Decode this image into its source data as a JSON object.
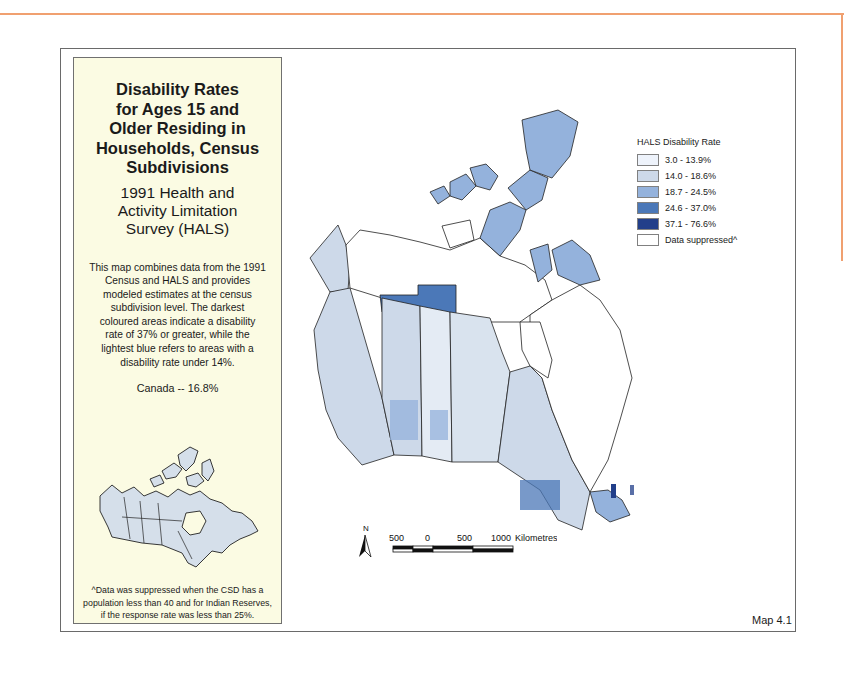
{
  "info_panel": {
    "title_lines": [
      "Disability Rates",
      "for Ages 15 and",
      "Older Residing in",
      "Households, Census",
      "Subdivisions"
    ],
    "subtitle_lines": [
      "1991 Health and",
      "Activity Limitation",
      "Survey (HALS)"
    ],
    "description_lines": [
      "This map combines data from the 1991",
      "Census and HALS and provides",
      "modeled estimates at the census",
      "subdivision level.  The darkest",
      "coloured areas indicate a disability",
      "rate of 37% or greater, while the",
      "lightest blue refers to areas with a",
      "disability rate under 14%."
    ],
    "national_rate": "Canada -- 16.8%",
    "footnote_lines": [
      "^Data was suppressed when the CSD has a",
      "population less than 40 and for Indian Reserves,",
      "if the response rate was less than 25%."
    ]
  },
  "legend": {
    "title": "HALS Disability Rate",
    "items": [
      {
        "label": "3.0 - 13.9%",
        "color": "#eef3fb"
      },
      {
        "label": "14.0 - 18.6%",
        "color": "#cdd9e9"
      },
      {
        "label": "18.7 - 24.5%",
        "color": "#94b2dc"
      },
      {
        "label": "24.6 - 37.0%",
        "color": "#4b78b8"
      },
      {
        "label": "37.1 - 76.6%",
        "color": "#223f8a"
      },
      {
        "label": "Data suppressed^",
        "color": "#ffffff"
      }
    ]
  },
  "scale": {
    "north_label": "N",
    "ticks": [
      "500",
      "0",
      "500",
      "1000"
    ],
    "unit": "Kilometres"
  },
  "map_label": "Map 4.1",
  "colors": {
    "accent_rule": "#f0a070",
    "panel_bg": "#fbfbe3",
    "inset_fill": "#d5dfea"
  }
}
